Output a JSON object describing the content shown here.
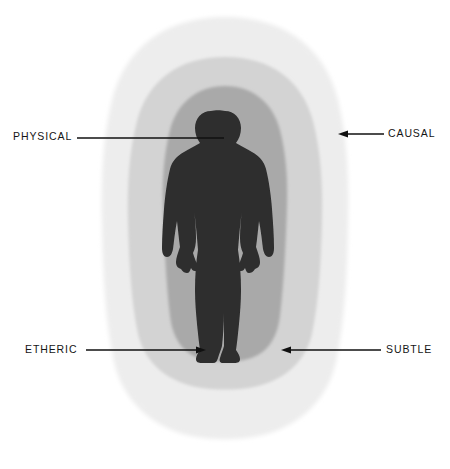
{
  "figure": {
    "background_color": "#ffffff",
    "silhouette_color": "#2b2b2b"
  },
  "layers": [
    {
      "key": "causal",
      "label": "CAUSAL",
      "order": 4,
      "description": "outermost aura layer",
      "color": "#ececec"
    },
    {
      "key": "subtle",
      "label": "SUBTLE",
      "order": 3,
      "description": "middle aura layer",
      "color": "#d2d2d2"
    },
    {
      "key": "etheric",
      "label": "ETHERIC",
      "order": 2,
      "description": "inner aura layer closest to body",
      "color": "#a8a8a8"
    },
    {
      "key": "physical",
      "label": "PHYSICAL",
      "order": 1,
      "description": "the physical body silhouette",
      "color": "#2b2b2b"
    }
  ],
  "callouts": [
    {
      "key": "physical",
      "text": "PHYSICAL",
      "side": "left",
      "marker": "line",
      "target": "head-of-silhouette"
    },
    {
      "key": "causal",
      "text": "CAUSAL",
      "side": "right",
      "marker": "arrow",
      "target": "outermost-layer"
    },
    {
      "key": "etheric",
      "text": "ETHERIC",
      "side": "left",
      "marker": "arrow",
      "target": "inner-layer"
    },
    {
      "key": "subtle",
      "text": "SUBTLE",
      "side": "right",
      "marker": "arrow",
      "target": "middle-layer"
    }
  ],
  "leader_lines": {
    "stroke_color": "#101010"
  }
}
